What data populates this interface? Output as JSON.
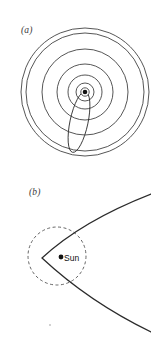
{
  "figure": {
    "background_color": "#ffffff",
    "stroke_color": "#2b2b2b",
    "width": 151,
    "height": 344
  },
  "panels": [
    {
      "id": "a",
      "label": "(a)",
      "caption_style": "italic",
      "description": "Concentric planetary orbits about the Sun with a long narrow cometary ellipse",
      "center": {
        "x": 85,
        "y": 92
      },
      "sun_marker": {
        "x": 85,
        "y": 92,
        "radius": 2.6,
        "filled": true
      },
      "orbits": [
        {
          "name": "orbit-1",
          "radius": 9
        },
        {
          "name": "orbit-2",
          "radius": 17
        },
        {
          "name": "orbit-3",
          "radius": 28
        },
        {
          "name": "orbit-4",
          "radius": 43
        },
        {
          "name": "orbit-5",
          "radius": 59
        },
        {
          "name": "orbit-6",
          "radius": 64
        }
      ],
      "comet_ellipse": {
        "name": "comet-orbit",
        "semi_major": 31,
        "semi_minor": 9,
        "center": {
          "x": 79,
          "y": 122
        },
        "rotation_deg": 12
      }
    },
    {
      "id": "b",
      "label": "(b)",
      "caption_style": "italic",
      "description": "Near-parabolic cometary orbit passing close to the Sun, with the Earth orbit drawn as a dashed circle",
      "sun_marker": {
        "x": 61,
        "y": 85,
        "radius": 2.6,
        "filled": true
      },
      "sun_label": "Sun",
      "earth_orbit": {
        "name": "earth-orbit-dashed-circle",
        "center": {
          "x": 57,
          "y": 84
        },
        "radius": 29,
        "dashed": true,
        "dash_pattern": "3,2.5"
      },
      "parabola": {
        "name": "comet-parabolic-trajectory",
        "vertex": {
          "x": 42,
          "y": 86
        },
        "opens": "right",
        "endpoints": [
          {
            "x": 151,
            "y": 22
          },
          {
            "x": 151,
            "y": 160
          }
        ]
      }
    }
  ],
  "artifacts": [
    {
      "name": "speck-mark",
      "x": 50,
      "y": 325,
      "size": 1.6
    }
  ]
}
